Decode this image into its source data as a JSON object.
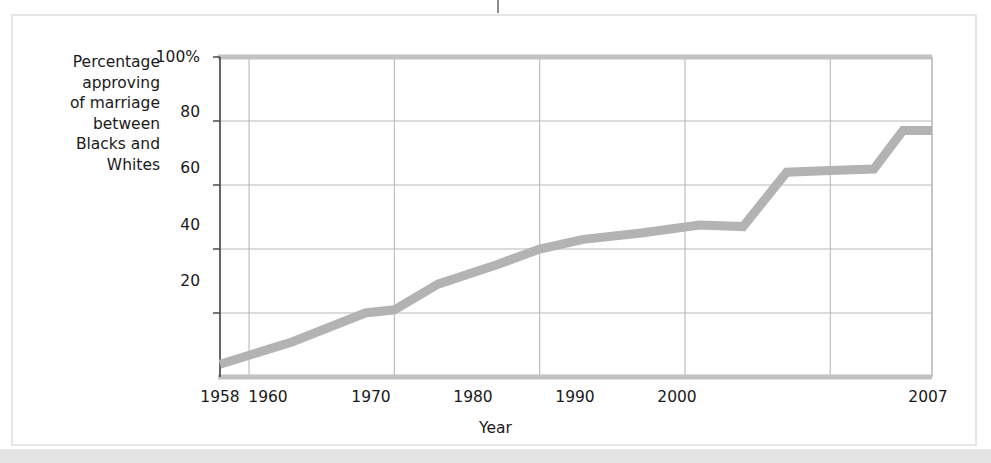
{
  "figure": {
    "background_color": "#ffffff",
    "frame_color": "#e6e6e6",
    "bottom_band_color": "#e4e4e4",
    "crop_tick_name": "page-binding-tick"
  },
  "chart_data": {
    "type": "line",
    "title": "",
    "subtitle": "",
    "xlabel": "Year",
    "ylabel": "Percentage\napproving\nof marriage\nbetween\nBlacks and\nWhites",
    "ylabel_lines": [
      "Percentage",
      "approving",
      "of marriage",
      "between",
      "Blacks and",
      "Whites"
    ],
    "xlim": [
      1958,
      2007
    ],
    "ylim": [
      0,
      100
    ],
    "grid": true,
    "legend": null,
    "legend_position": "none",
    "line_color": "#b3b3b3",
    "line_width": 9,
    "grid_color": "#b9b9b9",
    "axis_color": "#555555",
    "x_ticks": [
      1958,
      1960,
      1970,
      1980,
      1990,
      2000,
      2007
    ],
    "x_tick_labels": [
      "1958",
      "1960",
      "1970",
      "1980",
      "1990",
      "2000",
      "2007"
    ],
    "y_ticks": [
      20,
      40,
      60,
      80,
      100
    ],
    "y_tick_labels": [
      "20",
      "40",
      "60",
      "80",
      "100%"
    ],
    "x": [
      1958,
      1963,
      1968,
      1970,
      1973,
      1977,
      1980,
      1983,
      1987,
      1991,
      1994,
      1997,
      2000,
      2003,
      2005,
      2007
    ],
    "values": [
      4,
      11,
      20,
      21,
      29,
      35,
      40,
      43,
      45,
      47.5,
      47,
      64,
      64.5,
      65,
      77,
      77
    ],
    "series": [
      {
        "name": "Percentage approving of marriage between Blacks and Whites",
        "values": [
          4,
          11,
          20,
          21,
          29,
          35,
          40,
          43,
          45,
          47.5,
          47,
          64,
          64.5,
          65,
          77,
          77
        ]
      }
    ]
  }
}
